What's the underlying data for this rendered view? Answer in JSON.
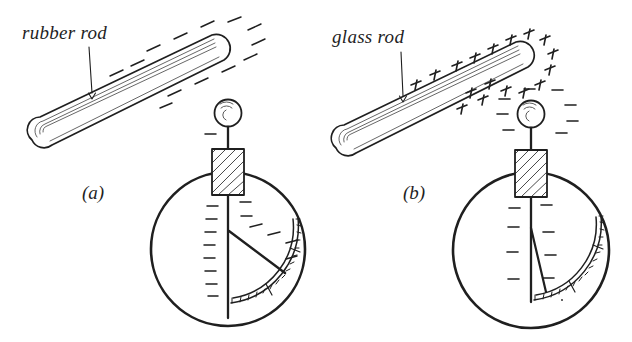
{
  "figure": {
    "background_color": "#ffffff",
    "ink_color": "#1f1f1f",
    "width": 632,
    "height": 342
  },
  "labels": {
    "rubber_rod": "rubber rod",
    "glass_rod": "glass rod",
    "panel_a": "(a)",
    "panel_b": "(b)"
  },
  "panels": [
    {
      "id": "a",
      "label": "(a)",
      "rod": {
        "name": "rubber rod",
        "charge_symbol": "−",
        "charge_sign": "negative",
        "charge_mark_count": 13,
        "label_text": "rubber rod",
        "has_leader_arrow": true
      },
      "electroscope": {
        "knob_charge_symbol": "−",
        "knob_charge_count": 1,
        "stem_charge_symbol": "−",
        "stem_charge_count": 9,
        "needle_charge_symbol": "−",
        "needle_charge_count": 4,
        "needle_deflection_degrees": 62,
        "scale_tick_count": 16
      }
    },
    {
      "id": "b",
      "label": "(b)",
      "rod": {
        "name": "glass rod",
        "charge_symbol": "+",
        "charge_sign": "positive",
        "charge_mark_count": 17,
        "label_text": "glass rod",
        "has_leader_arrow": true
      },
      "electroscope": {
        "knob_charge_symbol": "−",
        "knob_charge_count": 8,
        "stem_charge_symbol": "−",
        "stem_charge_count": 6,
        "needle_charge_symbol": "−",
        "needle_charge_count": 0,
        "needle_deflection_degrees": 14,
        "scale_tick_count": 16
      }
    }
  ],
  "parts": {
    "knob": "metal knob sphere",
    "insulator": "hatched insulating plug",
    "case": "circular electroscope case",
    "stem": "vertical metal stem",
    "needle": "pivoting gold-leaf needle",
    "scale": "curved graduated scale"
  }
}
